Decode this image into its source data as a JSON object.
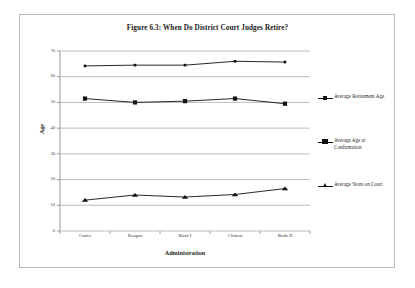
{
  "figure": {
    "title": "Figure 6.3: When Do District Court Judges Retire?",
    "x_axis_title": "Administration",
    "y_axis_title": "Age"
  },
  "chart_data": {
    "type": "line",
    "title": "Figure 6.3: When Do District Court Judges Retire?",
    "xlabel": "Administration",
    "ylabel": "Age",
    "categories": [
      "Carter",
      "Reagan",
      "Bush I",
      "Clinton",
      "Bush II"
    ],
    "ylim": [
      0,
      70
    ],
    "yticks": [
      0,
      10,
      20,
      30,
      40,
      50,
      60,
      70
    ],
    "ytick_labels": [
      "0",
      "10",
      "20",
      "30",
      "40",
      "50",
      "60",
      "70"
    ],
    "grid": true,
    "legend_position": "right",
    "series": [
      {
        "name": "Average Retirement Age",
        "marker": "small-square",
        "color": "#111111",
        "values": [
          64.2,
          64.5,
          64.5,
          66.0,
          65.7
        ]
      },
      {
        "name": "Average Age at Confirmation",
        "marker": "large-square",
        "color": "#111111",
        "values": [
          51.5,
          50.0,
          50.5,
          51.5,
          49.5
        ]
      },
      {
        "name": "Average Years on Court",
        "marker": "triangle",
        "color": "#111111",
        "values": [
          12.0,
          14.0,
          13.2,
          14.2,
          16.5
        ]
      }
    ]
  },
  "legend": {
    "entries": [
      {
        "label": "Average Retirement Age"
      },
      {
        "label": "Average Age at Confirmation"
      },
      {
        "label": "Average Years on Court"
      }
    ]
  }
}
